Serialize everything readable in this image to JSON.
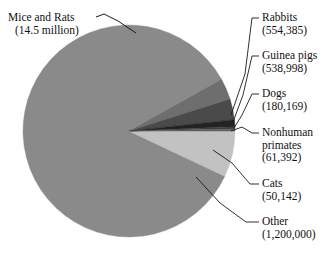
{
  "chart_data": {
    "type": "pie",
    "title": "",
    "subtitle": "",
    "xlabel": "",
    "ylabel": "",
    "legend_position": "none",
    "grid": false,
    "labels_inline": true,
    "unit": "animals used",
    "categories": [
      "Mice and Rats",
      "Rabbits",
      "Guinea pigs",
      "Dogs",
      "Nonhuman primates",
      "Cats",
      "Other"
    ],
    "values": [
      14500000,
      554385,
      538998,
      180169,
      61392,
      50142,
      1200000
    ],
    "value_text": [
      "(14.5 million)",
      "(554,385)",
      "(538,998)",
      "(180,169)",
      "(61,392)",
      "(50,142)",
      "(1,200,000)"
    ],
    "colors": [
      "#8a8a8a",
      "#6e6e6e",
      "#4a4a4a",
      "#232323",
      "#3d3d3d",
      "#5f5f5f",
      "#c2c2c2"
    ],
    "total": 17085086,
    "start_angle_deg": 0,
    "direction": "clockwise"
  },
  "geometry": {
    "center_x": 129,
    "center_y": 131,
    "radius": 106
  },
  "labels": {
    "mice": {
      "name": "Mice and Rats",
      "value": "(14.5 million)"
    },
    "rabbits": {
      "name": "Rabbits",
      "value": "(554,385)"
    },
    "guinea": {
      "name": "Guinea pigs",
      "value": "(538,998)"
    },
    "dogs": {
      "name": "Dogs",
      "value": "(180,169)"
    },
    "primates_line1": "Nonhuman",
    "primates_line2": "primates",
    "primates_value": "(61,392)",
    "cats": {
      "name": "Cats",
      "value": "(50,142)"
    },
    "other": {
      "name": "Other",
      "value": "(1,200,000)"
    }
  },
  "style": {
    "background": "#ffffff",
    "text_color": "#111111",
    "leader_color": "#1a1a1a"
  }
}
